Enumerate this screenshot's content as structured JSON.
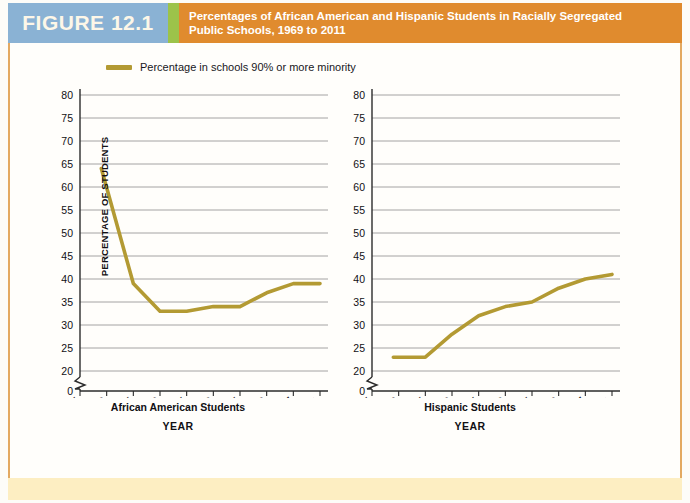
{
  "header": {
    "figure_number": "FIGURE 12.1",
    "title_line1": "Percentages of African American and Hispanic Students in Racially Segregated",
    "title_line2": "Public Schools, 1969 to 2011",
    "bar_color": "#e08b2e",
    "number_box_color": "#8ab2d4",
    "divider_color": "#9cc34a"
  },
  "legend": {
    "label": "Percentage in schools 90% or more minority",
    "swatch_color": "#b39a33"
  },
  "axes": {
    "y_axis_title": "PERCENTAGE OF STUDENTS",
    "x_axis_title": "YEAR",
    "y_ticks": [
      0,
      20,
      25,
      30,
      35,
      40,
      45,
      50,
      55,
      60,
      65,
      70,
      75,
      80
    ],
    "x_ticks": [
      "1965",
      "1970",
      "1975",
      "1980",
      "1985",
      "1990",
      "1995",
      "2000",
      "2007",
      "2011"
    ],
    "axis_break": true
  },
  "chart_data": [
    {
      "type": "line",
      "title": "African American Students",
      "xlabel": "YEAR",
      "ylabel": "PERCENTAGE OF STUDENTS",
      "series_name": "Percentage in schools 90% or more minority",
      "line_color": "#b39a33",
      "x": [
        1969,
        1975,
        1980,
        1985,
        1990,
        1995,
        2000,
        2007,
        2011
      ],
      "values": [
        64,
        39,
        33,
        33,
        34,
        34,
        37,
        39,
        39
      ],
      "categories": [
        "1969",
        "1975",
        "1980",
        "1985",
        "1990",
        "1995",
        "2000",
        "2007",
        "2011"
      ],
      "xlim": [
        1965,
        2011
      ],
      "ylim": [
        20,
        80
      ],
      "grid": true,
      "legend_position": "top-left"
    },
    {
      "type": "line",
      "title": "Hispanic Students",
      "xlabel": "YEAR",
      "ylabel": "PERCENTAGE OF STUDENTS",
      "series_name": "Percentage in schools 90% or more minority",
      "line_color": "#b39a33",
      "x": [
        1969,
        1975,
        1980,
        1985,
        1990,
        1995,
        2000,
        2007,
        2011
      ],
      "values": [
        23,
        23,
        28,
        32,
        34,
        35,
        38,
        40,
        41
      ],
      "categories": [
        "1969",
        "1975",
        "1980",
        "1985",
        "1990",
        "1995",
        "2000",
        "2007",
        "2011"
      ],
      "xlim": [
        1965,
        2011
      ],
      "ylim": [
        20,
        80
      ],
      "grid": true,
      "legend_position": "top-left"
    }
  ]
}
